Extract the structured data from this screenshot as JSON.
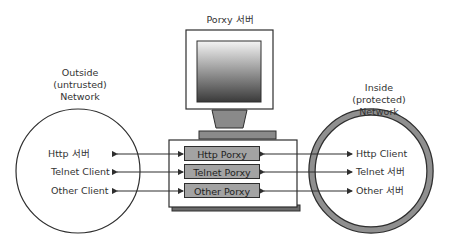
{
  "server": {
    "title": "Porxy 서버"
  },
  "outside": {
    "title_lines": [
      "Outside",
      "(untrusted)",
      "Network"
    ],
    "items": [
      "Http 서버",
      "Telnet Client",
      "Other Client"
    ]
  },
  "inside": {
    "title_lines": [
      "Inside",
      "(protected)",
      "Network"
    ],
    "items": [
      "Http Client",
      "Telnet 서버",
      "Other 서버"
    ]
  },
  "proxies": [
    "Http Porxy",
    "Telnet Porxy",
    "Other Porxy"
  ],
  "colors": {
    "screen_top": "#f4f4f4",
    "screen_bottom": "#3a3a3a",
    "proxy_fill": "#a3a3a3",
    "ring": "#8f8f8f",
    "line": "#2e2e2e"
  }
}
